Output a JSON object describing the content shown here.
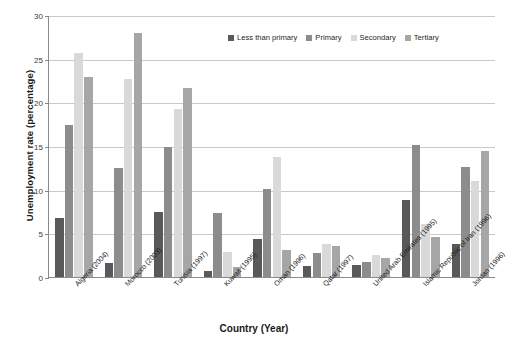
{
  "chart_data": {
    "type": "bar",
    "title": "",
    "xlabel": "Country (Year)",
    "ylabel": "Unemployment rate (percentage)",
    "ylim": [
      0,
      30
    ],
    "yticks": [
      0,
      5,
      10,
      15,
      20,
      25,
      30
    ],
    "ytick_labels": [
      "0",
      "5",
      "10",
      "15",
      "20",
      "25",
      "30"
    ],
    "grid": true,
    "legend_position": "top-right-inside",
    "categories": [
      "Algeria (2004)",
      "Morocco (2003)",
      "Tunisia (1997)",
      "Kuwait (1995)",
      "Oman (1996)",
      "Qatar (1997)",
      "United Arab Emirates (1995)",
      "Islamic Republic of Iran (1996)",
      "Jordan (1996)"
    ],
    "series": [
      {
        "name": "Less than primary",
        "color": "#595959",
        "values": [
          6.8,
          1.6,
          7.4,
          0.7,
          4.3,
          1.3,
          1.4,
          8.8,
          3.8
        ]
      },
      {
        "name": "Primary",
        "color": "#8c8c8c",
        "values": [
          17.4,
          12.5,
          14.9,
          7.3,
          10.1,
          2.8,
          1.7,
          15.1,
          12.6
        ]
      },
      {
        "name": "Secondary",
        "color": "#d9d9d9",
        "values": [
          25.7,
          22.7,
          19.2,
          2.9,
          13.7,
          3.8,
          2.5,
          6.1,
          11.0
        ]
      },
      {
        "name": "Tertiary",
        "color": "#a6a6a6",
        "values": [
          22.9,
          27.9,
          21.6,
          1.1,
          3.1,
          3.6,
          2.2,
          4.6,
          14.4
        ]
      }
    ]
  },
  "legend": {
    "items": [
      {
        "label": "Less than primary",
        "color": "#595959"
      },
      {
        "label": "Primary",
        "color": "#8c8c8c"
      },
      {
        "label": "Secondary",
        "color": "#d9d9d9"
      },
      {
        "label": "Tertiary",
        "color": "#a6a6a6"
      }
    ]
  },
  "axes": {
    "y_title": "Unemployment rate (percentage)",
    "x_title": "Country (Year)"
  }
}
